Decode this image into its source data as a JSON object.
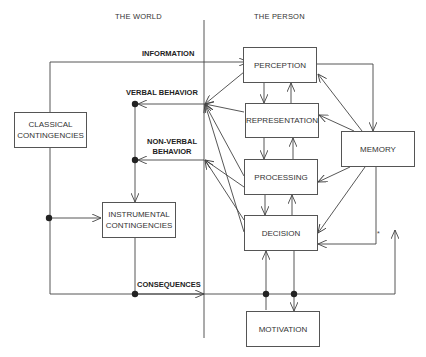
{
  "headers": {
    "world": "THE WORLD",
    "person": "THE PERSON"
  },
  "boxes": {
    "classical": "CLASSICAL CONTINGENCIES",
    "instrumental": "INSTRUMENTAL CONTINGENCIES",
    "perception": "PERCEPTION",
    "representation": "REPRESENTATION",
    "processing": "PROCESSING",
    "decision": "DECISION",
    "memory": "MEMORY",
    "motivation": "MOTIVATION"
  },
  "labels": {
    "information": "INFORMATION",
    "verbal": "VERBAL BEHAVIOR",
    "nonverbal_1": "NON-VERBAL",
    "nonverbal_2": "BEHAVIOR",
    "consequences": "CONSEQUENCES",
    "asterisk": "*"
  },
  "colors": {
    "line": "#444444",
    "box_border": "#555555",
    "text": "#333333"
  }
}
